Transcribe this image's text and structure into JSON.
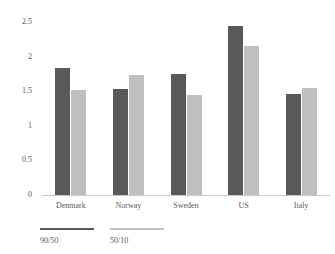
{
  "chart_data": {
    "type": "bar",
    "title": "",
    "subtitle": "",
    "xlabel": "",
    "ylabel": "",
    "ylim": [
      0,
      2.5
    ],
    "yticks": [
      "0",
      "0.5",
      "1",
      "1.5",
      "2",
      "2.5"
    ],
    "ytick_values": [
      0,
      0.5,
      1,
      1.5,
      2,
      2.5
    ],
    "grid": false,
    "legend_position": "bottom-left",
    "categories": [
      "Denmark",
      "Norway",
      "Sweden",
      "US",
      "Italy"
    ],
    "series": [
      {
        "name": "90/50",
        "color": "#595959",
        "values": [
          1.85,
          1.55,
          1.77,
          2.45,
          1.48
        ]
      },
      {
        "name": "50/10",
        "color": "#bfbfbf",
        "values": [
          1.53,
          1.75,
          1.46,
          2.17,
          1.56
        ]
      }
    ]
  },
  "legend": {
    "items": [
      {
        "label": "90/50",
        "color": "#595959"
      },
      {
        "label": "50/10",
        "color": "#bfbfbf"
      }
    ]
  },
  "colors": {
    "series_dark": "#595959",
    "series_light": "#bfbfbf",
    "axis": "#c9c9c9",
    "text": "#595959",
    "background": "#ffffff"
  }
}
